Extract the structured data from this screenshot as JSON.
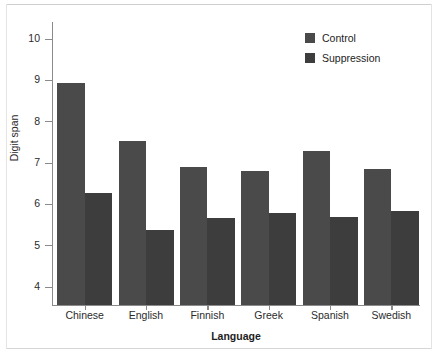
{
  "chart_data": {
    "type": "bar",
    "title": "",
    "xlabel": "Language",
    "ylabel": "Digit span",
    "categories": [
      "Chinese",
      "English",
      "Finnish",
      "Greek",
      "Spanish",
      "Swedish"
    ],
    "series": [
      {
        "name": "Control",
        "color": "#4a4a4a",
        "values": [
          8.93,
          7.53,
          6.9,
          6.8,
          7.29,
          6.85
        ]
      },
      {
        "name": "Suppression",
        "color": "#3d3d3d",
        "values": [
          6.27,
          5.38,
          5.66,
          5.79,
          5.69,
          5.83
        ]
      }
    ],
    "ylim": [
      3.6,
      10.35
    ],
    "yticks": [
      4,
      5,
      6,
      7,
      8,
      9,
      10
    ],
    "ytick_labels": [
      "4",
      "5",
      "6",
      "7",
      "8",
      "9",
      "10"
    ],
    "grid": false,
    "legend_position": "top-right",
    "axis_color": "#8a8a8a",
    "text_color": "#2b2b2b",
    "background": "#ffffff"
  }
}
